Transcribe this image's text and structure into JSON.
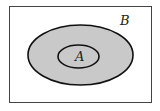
{
  "diagram": {
    "type": "venn",
    "universe": {
      "label": "B",
      "x": 9,
      "y": 6,
      "width": 142,
      "height": 97
    },
    "outer_set": {
      "cx": 80.5,
      "cy": 55,
      "rx": 52.5,
      "ry": 30,
      "fill": "#c9c9c9",
      "stroke": "#111111"
    },
    "inner_set": {
      "label": "A",
      "cx": 78.5,
      "cy": 56.5,
      "rx": 20.5,
      "ry": 11.5,
      "fill": "#c9c9c9",
      "stroke": "#111111"
    },
    "background": "#ffffff"
  }
}
